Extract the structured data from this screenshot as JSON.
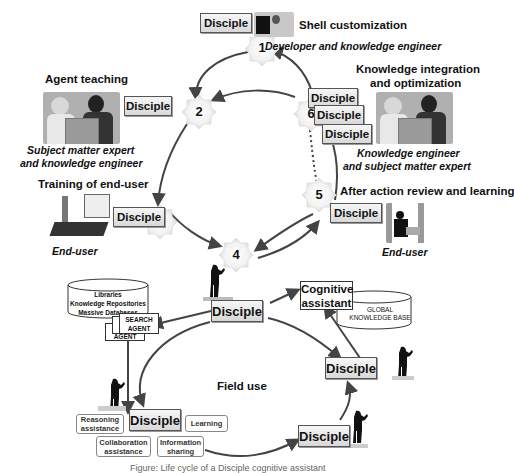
{
  "stages": [
    {
      "num": "1",
      "title": "Shell customization",
      "role": "Developer and knowledge engineer",
      "disciple": "Disciple"
    },
    {
      "num": "2",
      "title": "Agent teaching",
      "role": "Subject matter expert\nand knowledge engineer",
      "role_lines": [
        "Subject matter expert",
        "and knowledge engineer"
      ],
      "disciple": "Disciple"
    },
    {
      "num": "3",
      "title": "Training of end-user",
      "role": "End-user",
      "disciple": "Disciple"
    },
    {
      "num": "4",
      "title": "",
      "role": "",
      "disciple": "Disciple"
    },
    {
      "num": "5",
      "title": "After action review and learning",
      "role": "End-user",
      "disciple": "Disciple"
    },
    {
      "num": "6",
      "title_lines": [
        "Knowledge integration",
        "and optimization"
      ],
      "role_lines": [
        "Knowledge engineer",
        "and subject matter expert"
      ],
      "disciples": [
        "Disciple",
        "Disciple",
        "Disciple"
      ]
    }
  ],
  "field_use": {
    "label": "Field use",
    "database_lines": [
      "Libraries",
      "Knowledge Repositories",
      "Massive Databases"
    ],
    "agents": [
      {
        "lines": [
          "SEARCH",
          "AGENT"
        ]
      },
      {
        "lines": [
          "AGENT"
        ]
      },
      {
        "lines": [
          "AGENT"
        ]
      }
    ],
    "cognitive_assistant_lines": [
      "Cognitive",
      "assistant"
    ],
    "global_kb_lines": [
      "GLOBAL",
      "KNOWLEDGE BASE"
    ],
    "disciple_nodes": [
      "Disciple",
      "Disciple",
      "Disciple",
      "Disciple"
    ],
    "callouts": {
      "reasoning": [
        "Reasoning",
        "assistance"
      ],
      "learning": [
        "Learning"
      ],
      "collaboration": [
        "Collaboration",
        "assistance"
      ],
      "information": [
        "Information",
        "sharing"
      ]
    }
  },
  "caption": "Figure: Life cycle of a Disciple cognitive assistant"
}
